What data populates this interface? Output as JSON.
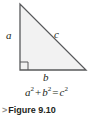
{
  "figure": {
    "caption_marker": ">",
    "caption_text": "Figure 9.10",
    "background_color": "#ffffff",
    "ink_color": "#231f20",
    "marker_color": "#8c8c8c"
  },
  "diagram": {
    "type": "right-triangle",
    "fill_color": "#f2f2f2",
    "stroke_color": "#58595b",
    "vertices": {
      "apex": [
        20,
        4
      ],
      "right_angle": [
        20,
        70
      ],
      "right_vertex": [
        86,
        70
      ]
    },
    "right_angle_marker": true,
    "labels": {
      "vertical_leg": "a",
      "hypotenuse": "c",
      "horizontal_leg": "b"
    }
  },
  "equation": {
    "full": "a² + b² = c²",
    "terms": {
      "a_base": "a",
      "a_exp": "2",
      "plus": "+",
      "b_base": "b",
      "b_exp": "2",
      "equals": "=",
      "c_base": "c",
      "c_exp": "2"
    }
  }
}
